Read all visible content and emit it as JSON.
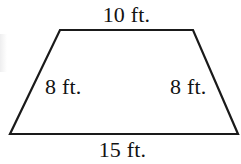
{
  "figure": {
    "type": "trapezoid",
    "shape_name": "isosceles-trapezoid",
    "background_color": "#ffffff",
    "stroke_color": "#1a1a1a",
    "stroke_width": 2.2,
    "text_color": "#131313",
    "vertices": {
      "top_left": [
        60,
        30
      ],
      "top_right": [
        193,
        30
      ],
      "bottom_right": [
        238,
        134
      ],
      "bottom_left": [
        10,
        134
      ]
    },
    "polygon_points": "60,30 193,30 238,134 10,134"
  },
  "labels": {
    "top": "10 ft.",
    "bottom": "15 ft.",
    "left_leg": "8 ft.",
    "right_leg": "8 ft."
  },
  "measurements": {
    "top_base": {
      "value": 10,
      "unit": "ft."
    },
    "bottom_base": {
      "value": 15,
      "unit": "ft."
    },
    "left_leg": {
      "value": 8,
      "unit": "ft."
    },
    "right_leg": {
      "value": 8,
      "unit": "ft."
    }
  }
}
